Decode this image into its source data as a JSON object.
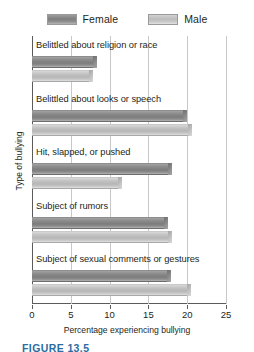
{
  "legend": {
    "items": [
      {
        "label": "Female",
        "key": "female",
        "color": "#8a8a8a"
      },
      {
        "label": "Male",
        "key": "male",
        "color": "#c2c2c2"
      }
    ]
  },
  "axes": {
    "ylabel": "Type of bullying",
    "xlabel": "Percentage experiencing bullying",
    "xticks": [
      "0",
      "5",
      "10",
      "15",
      "20",
      "25"
    ]
  },
  "caption": "FIGURE 13.5",
  "chart_data": {
    "type": "bar",
    "orientation": "horizontal",
    "title": "",
    "xlabel": "Percentage experiencing bullying",
    "ylabel": "Type of bullying",
    "xlim": [
      0,
      25
    ],
    "xticks": [
      0,
      5,
      10,
      15,
      20,
      25
    ],
    "grid": true,
    "legend_position": "top-center",
    "categories": [
      "Belittled about religion or race",
      "Belittled about looks or speech",
      "Hit, slapped, or pushed",
      "Subject of rumors",
      "Subject of sexual comments or gestures"
    ],
    "series": [
      {
        "name": "Female",
        "color": "#8a8a8a",
        "values": [
          8.4,
          20.0,
          18.0,
          17.5,
          17.9
        ]
      },
      {
        "name": "Male",
        "color": "#c2c2c2",
        "values": [
          7.9,
          20.6,
          11.6,
          18.0,
          20.5
        ]
      }
    ]
  }
}
